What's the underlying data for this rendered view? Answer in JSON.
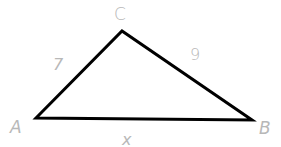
{
  "diagram": {
    "type": "triangle",
    "vertices": {
      "A": {
        "label": "A",
        "x": 36,
        "y": 118
      },
      "B": {
        "label": "B",
        "x": 252,
        "y": 120
      },
      "C": {
        "label": "C",
        "x": 122,
        "y": 31
      }
    },
    "sides": {
      "AC": {
        "label": "7"
      },
      "CB": {
        "label": "9"
      },
      "AB": {
        "label": "x"
      }
    },
    "colors": {
      "stroke": "#000000",
      "label": "#b8b8b8",
      "background": "#ffffff"
    }
  }
}
